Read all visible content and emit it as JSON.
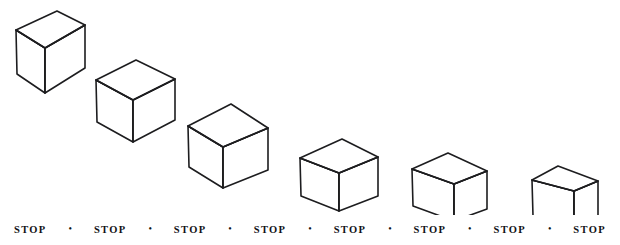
{
  "figure": {
    "background_color": "#ffffff",
    "line_color": "#1d1d1f",
    "face_fill": "#ffffff",
    "stroke_width": 1.6,
    "cube_count": 6,
    "cubes": [
      {
        "index": 1,
        "name": "cube-1",
        "top_face": "M 16,30 L 57,11 L 85,25 L 45,48 Z",
        "left_face": "M 16,30 L 45,48 L 45,93 L 17,74 Z",
        "right_face": "M 45,48 L 85,25 L 85,68 L 45,93 Z",
        "inner_edges": "M 45,48 L 16,30 M 45,48 L 85,25 M 45,48 L 45,93"
      },
      {
        "index": 2,
        "name": "cube-2",
        "top_face": "M 96,80 L 136,60 L 175,79 L 133,100 Z",
        "left_face": "M 96,80 L 133,100 L 133,142 L 97,122 Z",
        "right_face": "M 133,100 L 175,79 L 175,120 L 133,142 Z",
        "inner_edges": "M 133,100 L 96,80 M 133,100 L 175,79 M 133,100 L 133,142"
      },
      {
        "index": 3,
        "name": "cube-3",
        "top_face": "M 188,126 L 231,104 L 268,128 L 223,147 Z",
        "left_face": "M 188,126 L 223,147 L 223,188 L 189,167 Z",
        "right_face": "M 223,147 L 268,128 L 268,170 L 223,188 Z",
        "inner_edges": "M 223,147 L 188,126 M 223,147 L 268,128 M 223,147 L 223,188"
      },
      {
        "index": 4,
        "name": "cube-4",
        "top_face": "M 300,158 L 342,139 L 378,157 L 339,173 Z",
        "left_face": "M 300,158 L 339,173 L 339,211 L 301,196 Z",
        "right_face": "M 339,173 L 378,157 L 378,196 L 339,211 Z",
        "inner_edges": "M 339,173 L 300,158 M 339,173 L 378,157 M 339,173 L 339,211"
      },
      {
        "index": 5,
        "name": "cube-5",
        "top_face": "M 412,169 L 448,153 L 487,171 L 454,184 Z",
        "left_face": "M 412,169 L 454,184 L 454,221 L 413,206 Z",
        "right_face": "M 454,184 L 487,171 L 487,209 L 454,221 Z",
        "inner_edges": "M 454,184 L 412,169 M 454,184 L 487,171 M 454,184 L 454,221"
      },
      {
        "index": 6,
        "name": "cube-6",
        "top_face": "M 532,180 L 558,166 L 598,181 L 574,191 Z",
        "left_face": "M 532,180 L 574,191 L 574,229 L 533,216 Z",
        "right_face": "M 574,191 L 598,181 L 598,217 L 574,229 Z",
        "inner_edges": "M 574,191 L 532,180 M 574,191 L 598,181 M 574,191 L 574,229"
      }
    ]
  },
  "caption": {
    "name": "stop-caption-row",
    "separator": "•",
    "labels": [
      "STOP",
      "STOP",
      "STOP",
      "STOP",
      "STOP",
      "STOP",
      "STOP",
      "STOP"
    ]
  }
}
